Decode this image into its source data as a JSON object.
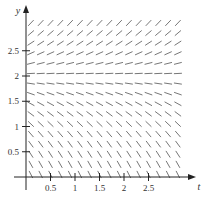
{
  "chart_data": {
    "type": "direction_field",
    "title": "",
    "equation_inferred": "dy/dt = y - 2",
    "xlabel": "t",
    "ylabel": "y",
    "xlim": [
      0,
      3.2
    ],
    "ylim": [
      0,
      3.1
    ],
    "x_ticks": [
      "0.5",
      "1",
      "1.5",
      "2",
      "2.5"
    ],
    "y_ticks": [
      "0.5",
      "1",
      "1.5",
      "2",
      "2.5"
    ],
    "grid_spacing": 0.2,
    "equilibrium": 2,
    "grid": false,
    "segment_color": "#666666",
    "axis_color": "#222222"
  }
}
